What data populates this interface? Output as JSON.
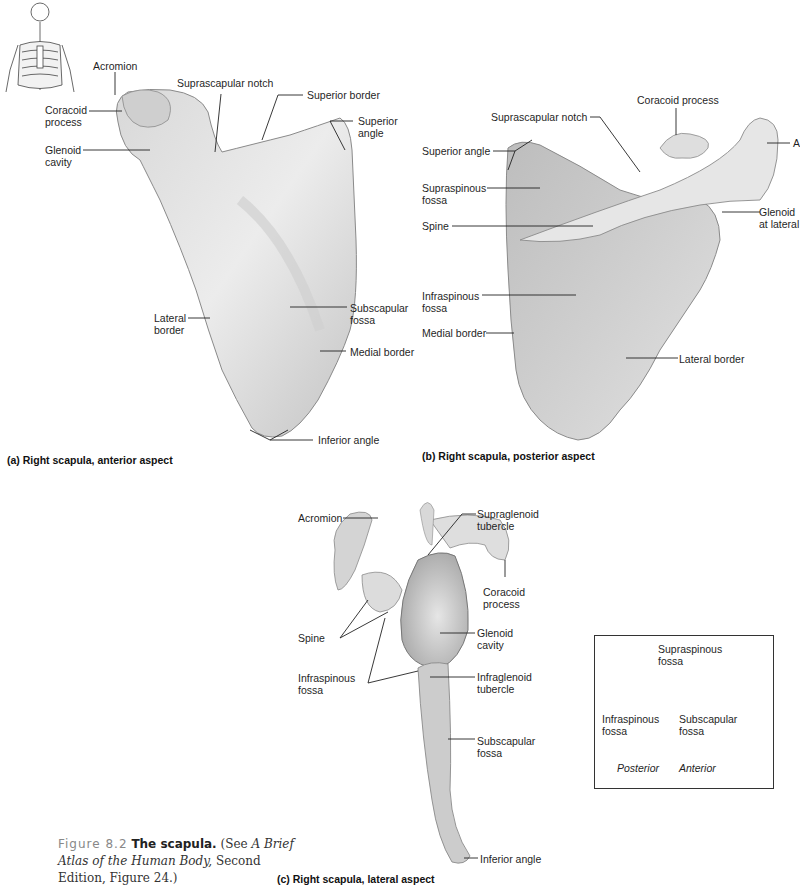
{
  "panel_a": {
    "caption": "(a) Right scapula, anterior aspect",
    "labels": {
      "acromion": "Acromion",
      "coracoid": "Coracoid\nprocess",
      "glenoid": "Glenoid\ncavity",
      "suprascapular_notch": "Suprascapular notch",
      "superior_border": "Superior border",
      "superior_angle": "Superior\nangle",
      "lateral_border": "Lateral\nborder",
      "subscapular_fossa": "Subscapular\nfossa",
      "medial_border": "Medial border",
      "inferior_angle": "Inferior angle"
    }
  },
  "panel_b": {
    "caption": "(b) Right scapula, posterior aspect",
    "labels": {
      "coracoid": "Coracoid process",
      "suprascapular_notch": "Suprascapular notch",
      "superior_angle": "Superior angle",
      "supraspinous_fossa": "Supraspinous\nfossa",
      "spine": "Spine",
      "acromion_cut": "A",
      "glenoid": "Glenoid\nat lateral",
      "infraspinous_fossa": "Infraspinous\nfossa",
      "medial_border": "Medial border",
      "lateral_border": "Lateral border"
    }
  },
  "panel_c": {
    "caption": "(c) Right scapula, lateral aspect",
    "labels": {
      "acromion": "Acromion",
      "supraglenoid": "Supraglenoid\ntubercle",
      "coracoid": "Coracoid\nprocess",
      "spine": "Spine",
      "glenoid": "Glenoid\ncavity",
      "infraspinous_fossa": "Infraspinous\nfossa",
      "infraglenoid": "Infraglenoid\ntubercle",
      "subscapular_fossa": "Subscapular\nfossa",
      "inferior_angle": "Inferior angle"
    }
  },
  "legend": {
    "supraspinous": "Supraspinous\nfossa",
    "infraspinous": "Infraspinous\nfossa",
    "subscapular": "Subscapular\nfossa",
    "posterior": "Posterior",
    "anterior": "Anterior"
  },
  "figure_caption": {
    "number": "Figure 8.2",
    "title": "The scapula.",
    "text_pre": " (See ",
    "book": "A Brief Atlas of the Human Body,",
    "text_post": " Second Edition, Figure 24.)"
  },
  "colors": {
    "bone_light": "#e9e9e9",
    "bone_mid": "#c9c9c9",
    "bone_dark": "#9a9a9a",
    "leader": "#222222"
  }
}
